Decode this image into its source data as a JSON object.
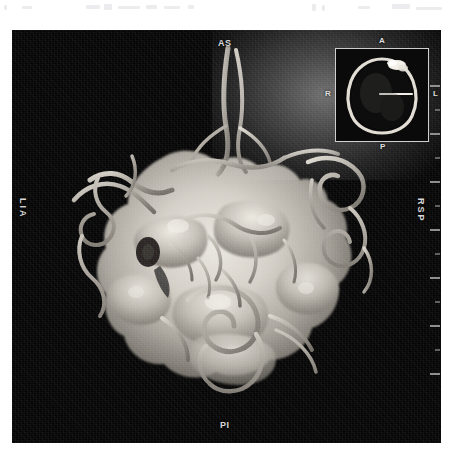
{
  "viewer": {
    "modality_description": "3D volume-rendered MR angiography of cerebral vasculature",
    "background_color": "#050505",
    "frame": {
      "left": 12,
      "top": 30,
      "width": 429,
      "height": 413
    }
  },
  "orientation_labels": {
    "top": "AS",
    "bottom": "PI",
    "left": "LIA",
    "right": "RSP"
  },
  "localizer_inset": {
    "labels": {
      "anterior": "A",
      "posterior": "P",
      "right": "R",
      "left": "L"
    },
    "border_color": "#cfcfcf"
  },
  "ruler": {
    "tick_count": 13,
    "tick_color": "#9a9a9a"
  },
  "colors": {
    "vessel_bright": "#e8e4dc",
    "vessel_mid": "#b6b1a8",
    "vessel_dark": "#6e6a63",
    "surface_highlight": "#f2efe8",
    "background": "#050505",
    "label_text": "#d8d8d8"
  }
}
